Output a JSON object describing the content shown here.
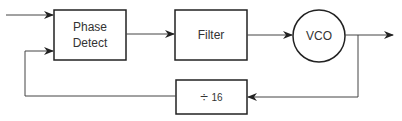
{
  "diagram": {
    "blocks": {
      "phase_detect": {
        "line1": "Phase",
        "line2": "Detect"
      },
      "filter": {
        "label": "Filter"
      },
      "vco": {
        "label": "VCO"
      },
      "divider": {
        "symbol": "÷",
        "value": "16"
      }
    },
    "colors": {
      "stroke": "#222222",
      "wire": "#444444",
      "text": "#333333"
    }
  }
}
